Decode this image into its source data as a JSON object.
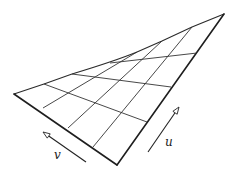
{
  "diagram": {
    "vertices": {
      "left": [
        14,
        94
      ],
      "top": [
        224,
        14
      ],
      "bottom": [
        117,
        165
      ]
    },
    "top_edge_path": "M14,94 L44,84 L72,74 C95,67 115,61 137,52 L162,41 L192,27 L224,14",
    "grid_cross_lines": [
      {
        "from": [
          44,
          84
        ],
        "to": [
          147,
          122
        ]
      },
      {
        "from": [
          72,
          74
        ],
        "to": [
          171,
          87
        ]
      },
      {
        "from": [
          110,
          63
        ],
        "to": [
          197,
          53
        ]
      }
    ],
    "grid_u_lines": [
      {
        "from": [
          43,
          108
        ],
        "to": [
          137,
          52
        ]
      },
      {
        "from": [
          68,
          128
        ],
        "to": [
          162,
          41
        ]
      },
      {
        "from": [
          93,
          147
        ],
        "to": [
          192,
          27
        ]
      }
    ],
    "arrows": [
      {
        "name": "v",
        "from": [
          86,
          162
        ],
        "to": [
          43,
          132
        ]
      },
      {
        "name": "u",
        "from": [
          148,
          152
        ],
        "to": [
          179,
          107
        ]
      }
    ],
    "labels": {
      "v": {
        "text": "v",
        "x": 54,
        "y": 159
      },
      "u": {
        "text": "u",
        "x": 165,
        "y": 146
      }
    },
    "stroke_color": "#2a2a2a"
  }
}
